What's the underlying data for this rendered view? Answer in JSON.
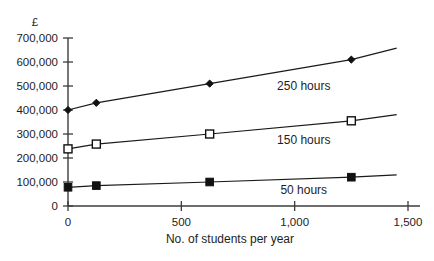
{
  "chart_data": {
    "type": "line",
    "title": "",
    "xlabel": "No. of students per year",
    "ylabel": "£",
    "xlim": [
      0,
      1500
    ],
    "ylim": [
      0,
      700000
    ],
    "grid": false,
    "legend_position": "inline-right",
    "x_ticks": [
      0,
      500,
      1000,
      1500
    ],
    "x_tick_labels": [
      "0",
      "500",
      "1,000",
      "1,500"
    ],
    "y_ticks": [
      0,
      100000,
      200000,
      300000,
      400000,
      500000,
      600000,
      700000
    ],
    "y_tick_labels": [
      "0",
      "100,000",
      "200,000",
      "300,000",
      "400,000",
      "500,000",
      "600,000",
      "700,000"
    ],
    "x": [
      0,
      125,
      625,
      1250
    ],
    "series": [
      {
        "name": "250 hours",
        "label": "250 hours",
        "marker": "diamond-filled",
        "values": [
          400000,
          430000,
          510000,
          610000
        ],
        "line_extends_to_x": 1450,
        "line_extends_to_y": 658000,
        "label_x": 1040,
        "label_y": 485000
      },
      {
        "name": "150 hours",
        "label": "150 hours",
        "marker": "square-open",
        "values": [
          238000,
          258000,
          300000,
          355000
        ],
        "line_extends_to_x": 1450,
        "line_extends_to_y": 381000,
        "label_x": 1040,
        "label_y": 258000
      },
      {
        "name": "50 hours",
        "label": "50 hours",
        "marker": "square-filled",
        "values": [
          78000,
          85000,
          100000,
          120000
        ],
        "line_extends_to_x": 1450,
        "line_extends_to_y": 130000,
        "label_x": 1040,
        "label_y": 52000
      }
    ],
    "colors": {
      "axis": "#3c3c3c",
      "line": "#1a1a1a",
      "marker_fill": "#111111",
      "marker_open_fill": "#ffffff",
      "text": "#1d1d1d",
      "background": "#ffffff"
    }
  }
}
